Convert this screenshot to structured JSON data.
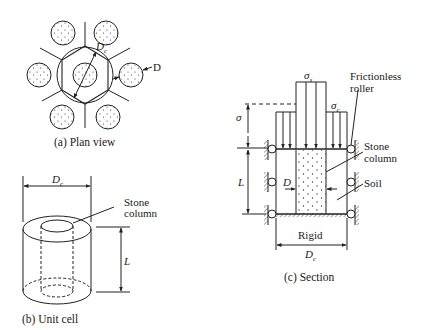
{
  "plan_view": {
    "caption": "(a) Plan view",
    "label_dc": "D",
    "label_dc_sub": "c",
    "label_d": "D"
  },
  "unit_cell": {
    "caption": "(b) Unit cell",
    "label_dc": "D",
    "label_dc_sub": "c",
    "label_stone": "Stone",
    "label_column": "column",
    "label_l": "L"
  },
  "section": {
    "caption": "(c) Section",
    "label_sigma_s": "σ",
    "label_sigma_s_sub": "s",
    "label_sigma_c": "σ",
    "label_sigma_c_sub": "c",
    "label_sigma": "σ",
    "label_frictionless": "Frictionless",
    "label_roller": "roller",
    "label_stone": "Stone",
    "label_column": "column",
    "label_soil": "Soil",
    "label_l": "L",
    "label_d": "D",
    "label_rigid": "Rigid",
    "label_dc": "D",
    "label_dc_sub": "c"
  }
}
